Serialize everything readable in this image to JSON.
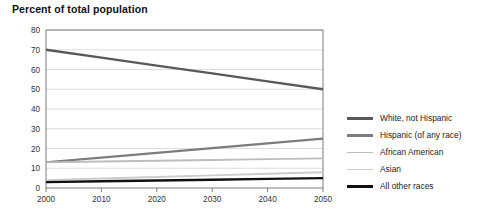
{
  "chart_data": {
    "type": "line",
    "title": "Percent of total population",
    "xlabel": "",
    "ylabel": "",
    "x": [
      2000,
      2010,
      2020,
      2030,
      2040,
      2050
    ],
    "xlim": [
      2000,
      2050
    ],
    "ylim": [
      0,
      80
    ],
    "xticks": [
      "2000",
      "2010",
      "2020",
      "2030",
      "2040",
      "2050"
    ],
    "yticks": [
      "0",
      "10",
      "20",
      "30",
      "40",
      "50",
      "60",
      "70",
      "80"
    ],
    "grid": "horizontal",
    "legend_position": "right",
    "series": [
      {
        "name": "White, not Hispanic",
        "color": "#595959",
        "width": 2.3,
        "values": [
          70,
          66,
          62,
          58,
          54,
          50
        ]
      },
      {
        "name": "Hispanic (of any race)",
        "color": "#7d7d7d",
        "width": 2.1,
        "values": [
          13,
          15.4,
          17.8,
          20.2,
          22.6,
          25
        ]
      },
      {
        "name": "African American",
        "color": "#bdbdbd",
        "width": 1.9,
        "values": [
          13,
          13.4,
          13.8,
          14.2,
          14.6,
          15
        ]
      },
      {
        "name": "Asian",
        "color": "#cccccc",
        "width": 1.9,
        "values": [
          4,
          4.8,
          5.6,
          6.4,
          7.2,
          8
        ]
      },
      {
        "name": "All other races",
        "color": "#111111",
        "width": 2.4,
        "values": [
          3,
          3.4,
          3.8,
          4.2,
          4.6,
          5
        ]
      }
    ]
  },
  "legend": {
    "items": [
      {
        "label": "White, not Hispanic"
      },
      {
        "label": "Hispanic (of any race)"
      },
      {
        "label": "African American"
      },
      {
        "label": "Asian"
      },
      {
        "label": "All other races"
      }
    ]
  }
}
